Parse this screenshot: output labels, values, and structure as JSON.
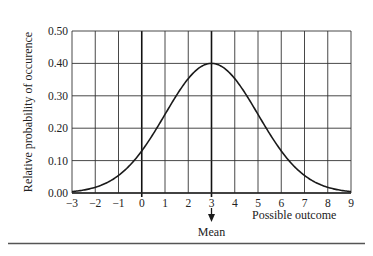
{
  "chart_data": {
    "type": "line",
    "title": "",
    "xlabel": "Possible outcome",
    "ylabel": "Relative probability of occurence",
    "xlim": [
      -3,
      9
    ],
    "ylim": [
      0,
      0.5
    ],
    "x_ticks": [
      -3,
      -2,
      -1,
      0,
      1,
      2,
      3,
      4,
      5,
      6,
      7,
      8,
      9
    ],
    "x_tick_labels": [
      "−3",
      "−2",
      "−1",
      "0",
      "1",
      "2",
      "3",
      "4",
      "5",
      "6",
      "7",
      "8",
      "9"
    ],
    "y_ticks": [
      0.0,
      0.1,
      0.2,
      0.3,
      0.4,
      0.5
    ],
    "y_tick_labels": [
      "0.00",
      "0.10",
      "0.20",
      "0.30",
      "0.40",
      "0.50"
    ],
    "grid": true,
    "bold_vertical_lines": [
      0,
      3
    ],
    "series": [
      {
        "name": "Normal curve",
        "distribution": {
          "mean": 3,
          "sd": 2,
          "peak": 0.4
        },
        "x": [
          -3,
          -2,
          -1,
          0,
          1,
          2,
          3,
          4,
          5,
          6,
          7,
          8,
          9
        ],
        "values": [
          0.004,
          0.018,
          0.054,
          0.13,
          0.243,
          0.353,
          0.4,
          0.353,
          0.243,
          0.13,
          0.054,
          0.018,
          0.004
        ]
      }
    ],
    "annotations": [
      {
        "text": "Mean",
        "x": 3,
        "type": "arrow-down-below-axis"
      }
    ]
  },
  "colors": {
    "line": "#1a1a1a",
    "grid": "#333333",
    "text": "#222222",
    "background": "#ffffff"
  }
}
